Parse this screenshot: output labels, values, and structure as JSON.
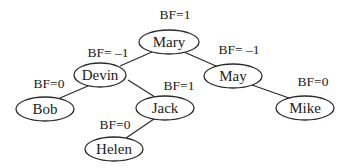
{
  "diagram": {
    "type": "AVL tree with balance factors",
    "nodes": [
      {
        "id": "mary",
        "label": "Mary",
        "bf": "BF=1",
        "cx": 169,
        "cy": 42,
        "rx": 30,
        "ry": 12,
        "bfx": 175,
        "bfy": 19
      },
      {
        "id": "devin",
        "label": "Devin",
        "bf": "BF= –1",
        "cx": 100,
        "cy": 75,
        "rx": 26,
        "ry": 12,
        "bfx": 108,
        "bfy": 57
      },
      {
        "id": "may",
        "label": "May",
        "bf": "BF= –1",
        "cx": 233,
        "cy": 76,
        "rx": 29,
        "ry": 12,
        "bfx": 239,
        "bfy": 54
      },
      {
        "id": "bob",
        "label": "Bob",
        "bf": "BF=0",
        "cx": 45,
        "cy": 109,
        "rx": 29,
        "ry": 12,
        "bfx": 49,
        "bfy": 88
      },
      {
        "id": "jack",
        "label": "Jack",
        "bf": "BF=1",
        "cx": 165,
        "cy": 108,
        "rx": 29,
        "ry": 12,
        "bfx": 179,
        "bfy": 90
      },
      {
        "id": "mike",
        "label": "Mike",
        "bf": "BF=0",
        "cx": 305,
        "cy": 108,
        "rx": 29,
        "ry": 12,
        "bfx": 313,
        "bfy": 86
      },
      {
        "id": "helen",
        "label": "Helen",
        "bf": "BF=0",
        "cx": 114,
        "cy": 149,
        "rx": 29,
        "ry": 12,
        "bfx": 115,
        "bfy": 129
      }
    ],
    "edges": [
      {
        "from": "mary",
        "to": "devin",
        "x1": 152,
        "y1": 52,
        "x2": 120,
        "y2": 66
      },
      {
        "from": "mary",
        "to": "may",
        "x1": 184,
        "y1": 52,
        "x2": 216,
        "y2": 66
      },
      {
        "from": "devin",
        "to": "bob",
        "x1": 88,
        "y1": 86,
        "x2": 60,
        "y2": 98
      },
      {
        "from": "devin",
        "to": "jack",
        "x1": 128,
        "y1": 80,
        "x2": 155,
        "y2": 97
      },
      {
        "from": "jack",
        "to": "helen",
        "x1": 154,
        "y1": 119,
        "x2": 126,
        "y2": 138
      },
      {
        "from": "may",
        "to": "mike",
        "x1": 252,
        "y1": 85,
        "x2": 289,
        "y2": 98
      }
    ]
  }
}
